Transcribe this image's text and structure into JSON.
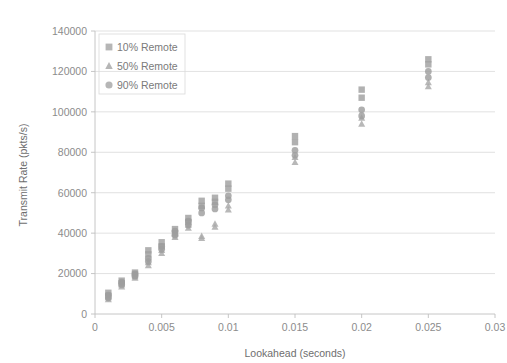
{
  "chart_data": {
    "type": "scatter",
    "title": "",
    "xlabel": "Lookahead (seconds)",
    "ylabel": "Transmit Rate (pkts/s)",
    "xlim": [
      0,
      0.03
    ],
    "ylim": [
      0,
      140000
    ],
    "xticks": [
      "0",
      "0.005",
      "0.01",
      "0.015",
      "0.02",
      "0.025",
      "0.03"
    ],
    "xtick_values": [
      0,
      0.005,
      0.01,
      0.015,
      0.02,
      0.025,
      0.03
    ],
    "yticks": [
      "0",
      "20000",
      "40000",
      "60000",
      "80000",
      "100000",
      "120000",
      "140000"
    ],
    "ytick_values": [
      0,
      20000,
      40000,
      60000,
      80000,
      100000,
      120000,
      140000
    ],
    "grid": "horizontal",
    "legend_position": "top-left-inside",
    "marker_color": "#a6a6a6",
    "series": [
      {
        "name": "10% Remote",
        "marker": "square",
        "color": "#a0a0a0",
        "x": [
          0.001,
          0.001,
          0.002,
          0.002,
          0.003,
          0.003,
          0.004,
          0.004,
          0.005,
          0.005,
          0.006,
          0.006,
          0.007,
          0.007,
          0.008,
          0.008,
          0.009,
          0.009,
          0.01,
          0.01,
          0.015,
          0.015,
          0.02,
          0.02,
          0.025,
          0.025
        ],
        "y": [
          10500,
          9000,
          16500,
          15200,
          20500,
          19500,
          31500,
          29500,
          35500,
          33500,
          42000,
          40000,
          47500,
          45500,
          56000,
          53500,
          57500,
          55500,
          64500,
          62000,
          88000,
          85000,
          111000,
          107000,
          126000,
          123500
        ]
      },
      {
        "name": "50% Remote",
        "marker": "triangle",
        "color": "#a8a8a8",
        "x": [
          0.001,
          0.001,
          0.002,
          0.002,
          0.003,
          0.003,
          0.004,
          0.004,
          0.005,
          0.005,
          0.006,
          0.006,
          0.007,
          0.007,
          0.008,
          0.008,
          0.009,
          0.009,
          0.01,
          0.01,
          0.015,
          0.015,
          0.02,
          0.02,
          0.025,
          0.025
        ],
        "y": [
          8200,
          7200,
          14500,
          13500,
          18500,
          17800,
          25500,
          24000,
          31500,
          30000,
          39500,
          38000,
          44000,
          42500,
          38500,
          37500,
          44500,
          43000,
          53500,
          51500,
          77500,
          75000,
          97000,
          94000,
          114500,
          112500
        ]
      },
      {
        "name": "90% Remote",
        "marker": "circle",
        "color": "#9d9d9d",
        "x": [
          0.001,
          0.001,
          0.002,
          0.002,
          0.003,
          0.003,
          0.004,
          0.004,
          0.005,
          0.005,
          0.006,
          0.006,
          0.007,
          0.007,
          0.008,
          0.008,
          0.009,
          0.009,
          0.01,
          0.01,
          0.015,
          0.015,
          0.02,
          0.02,
          0.025,
          0.025
        ],
        "y": [
          9400,
          8000,
          15800,
          14600,
          19800,
          18800,
          27500,
          26000,
          33500,
          32000,
          41000,
          39000,
          46000,
          44000,
          52500,
          50000,
          54000,
          52000,
          58500,
          56500,
          81000,
          78500,
          101000,
          98000,
          120000,
          117000
        ]
      }
    ]
  },
  "legend": {
    "items": [
      {
        "label": "10% Remote",
        "marker": "square"
      },
      {
        "label": "50% Remote",
        "marker": "triangle"
      },
      {
        "label": "90% Remote",
        "marker": "circle"
      }
    ]
  },
  "axes": {
    "x_title": "Lookahead (seconds)",
    "y_title": "Transmit Rate (pkts/s)"
  }
}
